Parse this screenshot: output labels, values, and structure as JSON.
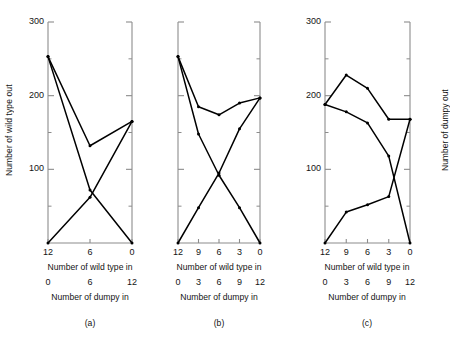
{
  "figure": {
    "ylabel_left": "Number of wild type out",
    "ylabel_right": "Number of dumpy out",
    "xlabel_primary": "Number of wild type in",
    "xlabel_secondary": "Number of dumpy in",
    "line_color": "#000000",
    "axis_color": "#8c8c8c",
    "background": "#ffffff"
  },
  "chart_data": [
    {
      "type": "line",
      "panel": "a",
      "caption": "(a)",
      "title": "",
      "xlabel": "Number of wild type in",
      "xlabel2": "Number of dumpy in",
      "ylabel": "Number of wild type out",
      "x": [
        12,
        6,
        0
      ],
      "xticks": [
        "12",
        "6",
        "0"
      ],
      "xticks_secondary": [
        "0",
        "6",
        "12"
      ],
      "yticks": [
        "300",
        "200",
        "100"
      ],
      "ytick_values": [
        300,
        200,
        100
      ],
      "ylim": [
        0,
        300
      ],
      "minor_yticks": [
        250,
        150,
        50
      ],
      "grid": false,
      "legend": "none",
      "series": [
        {
          "name": "wild type out (mixed)",
          "values": [
            253,
            132,
            165
          ]
        },
        {
          "name": "wild type out (declining)",
          "values": [
            253,
            72,
            0
          ]
        },
        {
          "name": "dumpy out (rising)",
          "values": [
            0,
            62,
            165
          ]
        }
      ]
    },
    {
      "type": "line",
      "panel": "b",
      "caption": "(b)",
      "title": "",
      "xlabel": "Number of wild type in",
      "xlabel2": "Number of dumpy in",
      "ylabel": "Number of wild type out",
      "x": [
        12,
        9,
        6,
        3,
        0
      ],
      "xticks": [
        "12",
        "9",
        "6",
        "3",
        "0"
      ],
      "xticks_secondary": [
        "0",
        "3",
        "6",
        "9",
        "12"
      ],
      "yticks": [],
      "ytick_values": [
        300,
        200,
        100
      ],
      "ylim": [
        0,
        300
      ],
      "minor_yticks": [
        250,
        150,
        50
      ],
      "grid": false,
      "legend": "none",
      "series": [
        {
          "name": "total out",
          "values": [
            253,
            185,
            174,
            190,
            197
          ]
        },
        {
          "name": "wild type out (declining)",
          "values": [
            253,
            148,
            92,
            48,
            0
          ]
        },
        {
          "name": "dumpy out (rising)",
          "values": [
            0,
            48,
            95,
            155,
            197
          ]
        }
      ]
    },
    {
      "type": "line",
      "panel": "c",
      "caption": "(c)",
      "title": "",
      "xlabel": "Number of wild type in",
      "xlabel2": "Number of dumpy in",
      "ylabel": "Number of dumpy out",
      "x": [
        12,
        9,
        6,
        3,
        0
      ],
      "xticks": [
        "12",
        "9",
        "6",
        "3",
        "0"
      ],
      "xticks_secondary": [
        "0",
        "3",
        "6",
        "9",
        "12"
      ],
      "yticks": [
        "300",
        "200",
        "100"
      ],
      "ytick_values": [
        300,
        200,
        100
      ],
      "ylim": [
        0,
        300
      ],
      "minor_yticks": [
        250,
        150,
        50
      ],
      "grid": false,
      "legend": "none",
      "series": [
        {
          "name": "total out",
          "values": [
            188,
            228,
            210,
            168,
            168
          ]
        },
        {
          "name": "wild type out (declining)",
          "values": [
            188,
            178,
            163,
            118,
            0
          ]
        },
        {
          "name": "dumpy out (rising)",
          "values": [
            0,
            42,
            52,
            63,
            168
          ]
        }
      ]
    }
  ]
}
